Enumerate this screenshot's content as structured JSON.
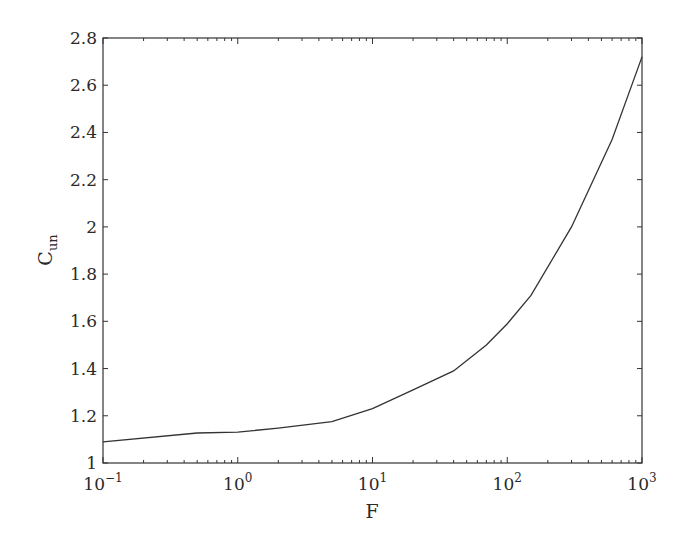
{
  "chart_data": {
    "type": "line",
    "title": "",
    "xlabel": "F",
    "ylabel": "C",
    "ylabel_subscript": "un",
    "xscale": "log",
    "xlim": [
      0.1,
      1000
    ],
    "ylim": [
      1,
      2.8
    ],
    "grid": false,
    "legend": null,
    "x_ticks": [
      {
        "base": "10",
        "exp": "−1",
        "value": 0.1
      },
      {
        "base": "10",
        "exp": "0",
        "value": 1
      },
      {
        "base": "10",
        "exp": "1",
        "value": 10
      },
      {
        "base": "10",
        "exp": "2",
        "value": 100
      },
      {
        "base": "10",
        "exp": "3",
        "value": 1000
      }
    ],
    "y_ticks": [
      "1",
      "1.2",
      "1.4",
      "1.6",
      "1.8",
      "2",
      "2.2",
      "2.4",
      "2.6",
      "2.8"
    ],
    "series": [
      {
        "name": "C_un",
        "color": "#333333",
        "x": [
          0.1,
          0.5,
          1,
          2,
          5,
          10,
          20,
          40,
          70,
          100,
          150,
          300,
          600,
          1000
        ],
        "values": [
          1.09,
          1.127,
          1.131,
          1.148,
          1.175,
          1.23,
          1.31,
          1.39,
          1.5,
          1.59,
          1.71,
          2.0,
          2.37,
          2.72
        ]
      }
    ]
  }
}
